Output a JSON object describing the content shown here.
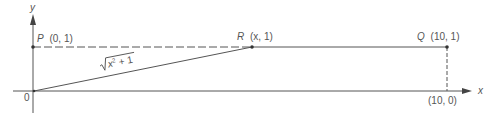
{
  "diagram": {
    "axes": {
      "x_label": "x",
      "y_label": "y",
      "origin_label": "0"
    },
    "points": {
      "P": {
        "name": "P",
        "coords": "(0, 1)"
      },
      "R": {
        "name": "R",
        "coords": "(x, 1)"
      },
      "Q": {
        "name": "Q",
        "coords": "(10, 1)"
      },
      "Q_foot": {
        "coords": "(10, 0)"
      }
    },
    "segment_label": {
      "radicand_base": "x",
      "exponent": "2",
      "rest": " + 1"
    },
    "colors": {
      "line": "#555555",
      "background": "#ffffff"
    }
  }
}
